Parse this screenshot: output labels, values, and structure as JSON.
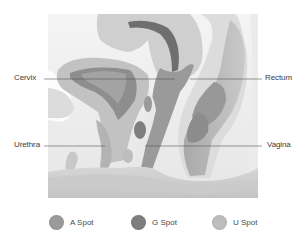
{
  "diagram": {
    "labels": {
      "cervix": "Cervix",
      "rectum": "Rectum",
      "urethra": "Urethra",
      "vagina": "Vagina"
    },
    "legend": [
      {
        "label": "A Spot",
        "color": "#9a9a9a"
      },
      {
        "label": "G Spot",
        "color": "#7e7e7e"
      },
      {
        "label": "U Spot",
        "color": "#bdbdbd"
      }
    ],
    "colors": {
      "background": "#ffffff",
      "frame_bg": "#f1f1f1",
      "tissue_light": "#d9d9d9",
      "tissue_mid": "#b9b9b9",
      "tissue_dark": "#8f8f8f",
      "tissue_darkest": "#6e6e6e",
      "leader_line": "#555555"
    }
  }
}
